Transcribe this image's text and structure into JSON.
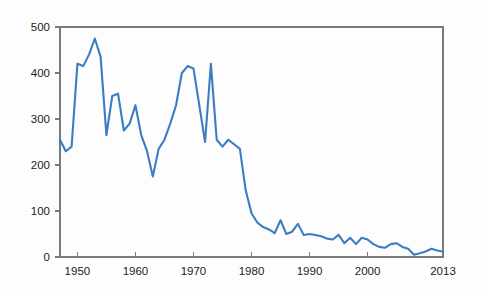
{
  "chart_data": {
    "type": "line",
    "title": "",
    "subtitle": "",
    "xlabel": "",
    "ylabel": "",
    "xlim": [
      1947,
      2013
    ],
    "ylim": [
      0,
      500
    ],
    "grid": false,
    "legend": "none",
    "line_color": "#3b7dc4",
    "axis_color": "#7a7a7a",
    "background_color": "#fdfdfd",
    "y_ticks": [
      0,
      100,
      200,
      300,
      400,
      500
    ],
    "y_tick_labels": [
      "0",
      "100",
      "200",
      "300",
      "400",
      "500"
    ],
    "x_ticks": [
      1950,
      1960,
      1970,
      1980,
      1990,
      2000,
      2013
    ],
    "x_tick_labels": [
      "1950",
      "1960",
      "1970",
      "1980",
      "1990",
      "2000",
      "2013"
    ],
    "series": [
      {
        "name": "value",
        "x": [
          1947,
          1948,
          1949,
          1950,
          1951,
          1952,
          1953,
          1954,
          1955,
          1956,
          1957,
          1958,
          1959,
          1960,
          1961,
          1962,
          1963,
          1964,
          1965,
          1966,
          1967,
          1968,
          1969,
          1970,
          1971,
          1972,
          1973,
          1974,
          1975,
          1976,
          1977,
          1978,
          1979,
          1980,
          1981,
          1982,
          1983,
          1984,
          1985,
          1986,
          1987,
          1988,
          1989,
          1990,
          1991,
          1992,
          1993,
          1994,
          1995,
          1996,
          1997,
          1998,
          1999,
          2000,
          2001,
          2002,
          2003,
          2004,
          2005,
          2006,
          2007,
          2008,
          2009,
          2010,
          2011,
          2012,
          2013
        ],
        "values": [
          255,
          230,
          240,
          420,
          415,
          440,
          475,
          435,
          265,
          350,
          355,
          275,
          290,
          330,
          265,
          230,
          175,
          235,
          255,
          290,
          330,
          400,
          415,
          410,
          330,
          250,
          420,
          255,
          240,
          255,
          245,
          235,
          145,
          95,
          75,
          65,
          60,
          52,
          80,
          50,
          55,
          72,
          48,
          50,
          48,
          45,
          40,
          38,
          48,
          30,
          42,
          28,
          42,
          38,
          28,
          22,
          20,
          28,
          30,
          22,
          18,
          5,
          8,
          12,
          18,
          14,
          12
        ]
      }
    ]
  },
  "axes": {
    "plot_left_px": 60,
    "plot_right_px": 443,
    "plot_top_px": 27,
    "plot_bottom_px": 257
  }
}
